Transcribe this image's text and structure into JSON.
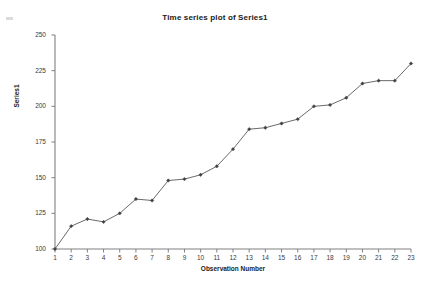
{
  "chart_data": {
    "type": "line",
    "title": "Time series plot of Series1",
    "xlabel": "Observation Number",
    "ylabel": "Series1",
    "x": [
      1,
      2,
      3,
      4,
      5,
      6,
      7,
      8,
      9,
      10,
      11,
      12,
      13,
      14,
      15,
      16,
      17,
      18,
      19,
      20,
      21,
      22,
      23
    ],
    "categories": [
      "1",
      "2",
      "3",
      "4",
      "5",
      "6",
      "7",
      "8",
      "9",
      "10",
      "11",
      "12",
      "13",
      "14",
      "15",
      "16",
      "17",
      "18",
      "19",
      "20",
      "21",
      "22",
      "23"
    ],
    "values": [
      100,
      116,
      121,
      119,
      125,
      135,
      134,
      148,
      149,
      152,
      158,
      170,
      184,
      185,
      188,
      191,
      200,
      201,
      206,
      216,
      218,
      218,
      230
    ],
    "series": [
      {
        "name": "Series1",
        "values": [
          100,
          116,
          121,
          119,
          125,
          135,
          134,
          148,
          149,
          152,
          158,
          170,
          184,
          185,
          188,
          191,
          200,
          201,
          206,
          216,
          218,
          218,
          230
        ]
      }
    ],
    "ylim": [
      100,
      250
    ],
    "xlim": [
      1,
      23
    ],
    "yticks": [
      100,
      125,
      150,
      175,
      200,
      225,
      250
    ],
    "ytick_labels": [
      "100",
      "125",
      "150",
      "175",
      "200",
      "225",
      "250"
    ],
    "xticks": [
      1,
      2,
      3,
      4,
      5,
      6,
      7,
      8,
      9,
      10,
      11,
      12,
      13,
      14,
      15,
      16,
      17,
      18,
      19,
      20,
      21,
      22,
      23
    ],
    "grid": false,
    "legend": false,
    "marker": "diamond",
    "line_color": "#595959",
    "marker_color": "#404040",
    "axis_color": "#808080",
    "text_color": "#1a1a1a"
  }
}
